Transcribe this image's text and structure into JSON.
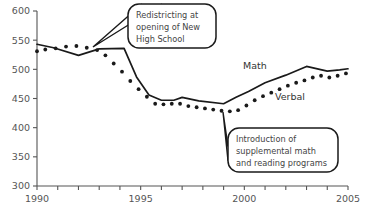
{
  "chart_data": {
    "type": "line",
    "title": "",
    "xlabel": "",
    "ylabel": "",
    "xlim": [
      1990,
      2005
    ],
    "ylim": [
      300,
      600
    ],
    "grid": false,
    "legend": "inline-labels",
    "x_ticks": [
      1990,
      1991,
      1992,
      1993,
      1994,
      1995,
      1996,
      1997,
      1998,
      1999,
      2000,
      2001,
      2002,
      2003,
      2004,
      2005
    ],
    "x_tick_labels": [
      "1990",
      "",
      "",
      "",
      "",
      "1995",
      "",
      "",
      "",
      "",
      "2000",
      "",
      "",
      "",
      "",
      "2005"
    ],
    "y_ticks": [
      300,
      350,
      400,
      450,
      500,
      550,
      600
    ],
    "y_tick_labels": [
      "300",
      "350",
      "400",
      "450",
      "500",
      "550",
      "600"
    ],
    "series": [
      {
        "name": "Math",
        "style": "solid-line",
        "x": [
          1990.0,
          1990.8,
          1992.0,
          1993.0,
          1994.2,
          1994.8,
          1995.4,
          1996.0,
          1996.6,
          1997.0,
          1997.8,
          1999.0,
          1999.6,
          2000.2,
          2001.0,
          2002.0,
          2003.0,
          2004.0,
          2004.6,
          2005.0
        ],
        "values": [
          543,
          537,
          524,
          535,
          536,
          487,
          456,
          447,
          447,
          452,
          446,
          441,
          452,
          462,
          477,
          490,
          505,
          497,
          499,
          501
        ]
      },
      {
        "name": "Verbal",
        "style": "dotted",
        "x": [
          1990.0,
          1990.4,
          1990.9,
          1991.4,
          1991.9,
          1992.4,
          1992.9,
          1993.3,
          1993.7,
          1994.1,
          1994.5,
          1994.9,
          1995.3,
          1995.7,
          1996.1,
          1996.5,
          1996.9,
          1997.3,
          1997.7,
          1998.1,
          1998.5,
          1998.9,
          1999.3,
          1999.7,
          2000.1,
          2000.5,
          2000.9,
          2001.3,
          2001.7,
          2002.1,
          2002.5,
          2002.9,
          2003.3,
          2003.7,
          2004.1,
          2004.5,
          2004.9
        ],
        "values": [
          531,
          534,
          536,
          539,
          540,
          537,
          533,
          524,
          510,
          496,
          480,
          466,
          453,
          441,
          440,
          441,
          441,
          437,
          435,
          433,
          431,
          429,
          428,
          430,
          438,
          447,
          454,
          460,
          466,
          472,
          477,
          481,
          486,
          489,
          486,
          489,
          493
        ]
      }
    ],
    "series_labels": [
      {
        "name": "math-series-label",
        "text": "Math",
        "x": 243,
        "y": 69
      },
      {
        "name": "verbal-series-label",
        "text": "Verbal",
        "x": 275,
        "y": 100
      }
    ],
    "annotations": [
      {
        "name": "redistricting-callout",
        "lines": [
          "Redistricting at",
          "opening of New",
          "High School"
        ],
        "box": {
          "x": 128,
          "y": 4,
          "w": 88,
          "h": 44,
          "r": 11
        },
        "pointer_target": {
          "x": 93,
          "y": 47
        }
      },
      {
        "name": "supplemental-programs-callout",
        "lines": [
          "Introduction of",
          "supplemental math",
          "and reading programs"
        ],
        "box": {
          "x": 228,
          "y": 128,
          "w": 110,
          "h": 44,
          "r": 11
        },
        "pointer_target": {
          "x": 223,
          "y": 112
        }
      }
    ],
    "colors": {
      "line": "#1a1a1a",
      "axis": "#555555",
      "tick_label": "#555555",
      "callout_text": "#444444",
      "background": "#ffffff"
    }
  }
}
